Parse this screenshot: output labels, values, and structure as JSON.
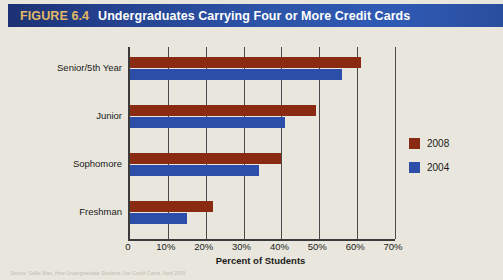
{
  "figure": {
    "number": "FIGURE 6.4",
    "title": "Undergraduates Carrying Four or More Credit Cards",
    "source_note": "Source: Sallie Mae, How Undergraduate Students Use Credit Cards, April 2009"
  },
  "colors": {
    "title_bar_dark": "#1C3173",
    "title_bar_light": "#2F5AB4",
    "figure_number": "#E3B964",
    "background": "#E9E7DD",
    "series_2008": "#8A2A12",
    "series_2004": "#2D4EA8",
    "axis": "#3A3A3A"
  },
  "legend": {
    "entries": [
      {
        "label": "2008",
        "color": "#8A2A12"
      },
      {
        "label": "2004",
        "color": "#2D4EA8"
      }
    ]
  },
  "axis": {
    "x_title": "Percent of Students",
    "x_ticks": [
      "0",
      "10%",
      "20%",
      "30%",
      "40%",
      "50%",
      "60%",
      "70%"
    ]
  },
  "chart_data": {
    "type": "bar",
    "orientation": "horizontal",
    "title": "Undergraduates Carrying Four or More Credit Cards",
    "xlabel": "Percent of Students",
    "ylabel": "",
    "xlim": [
      0,
      70
    ],
    "xticks": [
      0,
      10,
      20,
      30,
      40,
      50,
      60,
      70
    ],
    "xtick_labels": [
      "0",
      "10%",
      "20%",
      "30%",
      "40%",
      "50%",
      "60%",
      "70%"
    ],
    "grid": true,
    "legend_position": "right",
    "categories": [
      "Senior/5th Year",
      "Junior",
      "Sophomore",
      "Freshman"
    ],
    "series": [
      {
        "name": "2008",
        "color": "#8A2A12",
        "values": [
          61,
          49,
          40,
          22
        ]
      },
      {
        "name": "2004",
        "color": "#2D4EA8",
        "values": [
          56,
          41,
          34,
          15
        ]
      }
    ]
  }
}
